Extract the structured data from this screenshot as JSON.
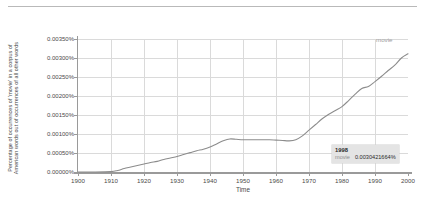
{
  "chart_data": {
    "type": "line",
    "title": "",
    "xlabel": "Time",
    "ylabel_line1": "Percentage of occurrences of 'movie' in a corpus of",
    "ylabel_line2": "American words out of occurrences of all other words",
    "xlim": [
      1900,
      2000
    ],
    "ylim": [
      0.0,
      0.0035
    ],
    "grid": true,
    "legend_position": "inline-right",
    "line_color": "#8c8c8c",
    "xticks": [
      1900,
      1910,
      1920,
      1930,
      1940,
      1950,
      1960,
      1970,
      1980,
      1990,
      2000
    ],
    "xtick_labels": [
      "1900",
      "1910",
      "1920",
      "1930",
      "1940",
      "1950",
      "1960",
      "1970",
      "1980",
      "1990",
      "2000"
    ],
    "yticks": [
      0.0,
      0.0005,
      0.001,
      0.0015,
      0.002,
      0.0025,
      0.003,
      0.0035
    ],
    "ytick_labels": [
      "0.00000%",
      "0.00050%",
      "0.00100%",
      "0.00150%",
      "0.00200%",
      "0.00250%",
      "0.00300%",
      "0.00350%"
    ],
    "series": [
      {
        "name": "movie",
        "label": "movie",
        "color": "#8c8c8c",
        "x": [
          1900,
          1905,
          1910,
          1912,
          1914,
          1916,
          1918,
          1920,
          1922,
          1924,
          1926,
          1928,
          1930,
          1932,
          1934,
          1936,
          1938,
          1940,
          1942,
          1944,
          1946,
          1948,
          1950,
          1952,
          1954,
          1956,
          1958,
          1960,
          1962,
          1964,
          1966,
          1968,
          1970,
          1972,
          1974,
          1976,
          1978,
          1980,
          1982,
          1984,
          1986,
          1988,
          1990,
          1992,
          1994,
          1996,
          1998,
          2000
        ],
        "values": [
          0.0,
          0.0,
          1e-05,
          4e-05,
          9e-05,
          0.00013,
          0.00017,
          0.00021,
          0.00025,
          0.00028,
          0.00033,
          0.00037,
          0.00041,
          0.00046,
          0.00051,
          0.00056,
          0.0006,
          0.00066,
          0.00074,
          0.00082,
          0.00087,
          0.00086,
          0.00085,
          0.00085,
          0.00085,
          0.00085,
          0.00085,
          0.00084,
          0.00083,
          0.00082,
          0.00085,
          0.00095,
          0.0011,
          0.00125,
          0.0014,
          0.00152,
          0.00162,
          0.00172,
          0.00188,
          0.00205,
          0.0022,
          0.00225,
          0.00238,
          0.00252,
          0.00267,
          0.00281,
          0.003,
          0.00311
        ]
      }
    ],
    "annotation": {
      "year": "1998",
      "series_name": "movie",
      "value": "0.0030421664%"
    }
  }
}
